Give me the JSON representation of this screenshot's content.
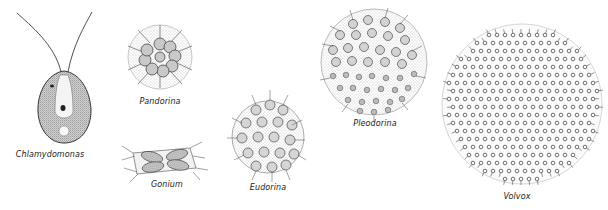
{
  "figure": {
    "organisms": [
      {
        "id": "chlamydomonas",
        "label": "Chlamydomonas",
        "label_x": 50,
        "label_y": 150
      },
      {
        "id": "pandorina",
        "label": "Pandorina",
        "label_x": 160,
        "label_y": 102
      },
      {
        "id": "gonium",
        "label": "Gonium",
        "label_x": 167,
        "label_y": 182
      },
      {
        "id": "eudorina",
        "label": "Eudorina",
        "label_x": 268,
        "label_y": 185
      },
      {
        "id": "pleodorina",
        "label": "Pleodorina",
        "label_x": 375,
        "label_y": 124
      },
      {
        "id": "volvox",
        "label": "Volvox",
        "label_x": 517,
        "label_y": 195
      }
    ]
  },
  "colors": {
    "ink": "#222222",
    "stipple": "#9a9a9a",
    "background": "#ffffff"
  }
}
